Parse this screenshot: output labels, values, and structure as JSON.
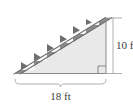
{
  "figure": {
    "name": "staircase-right-triangle",
    "shape": "right-triangle",
    "right_angle_vertex": "bottom-right",
    "step_count": 6
  },
  "labels": {
    "height": "10 ft",
    "base": "18 ft"
  },
  "dimensions": {
    "height_value": 10,
    "height_unit": "ft",
    "base_value": 18,
    "base_unit": "ft"
  },
  "colors": {
    "stringer_band": "#8d8d8d",
    "step_wedge": "#6e6e6e",
    "triangle_fill": "#e9e9e9",
    "outline": "#7a7a7a",
    "dimension_line": "#9a9a9a",
    "text": "#3a3a3a",
    "background": "#ffffff"
  },
  "annotations": {
    "right_angle_marker": "square",
    "base_brace": "curly-brace-down",
    "height_dimension": "vertical-line-with-ticks"
  }
}
